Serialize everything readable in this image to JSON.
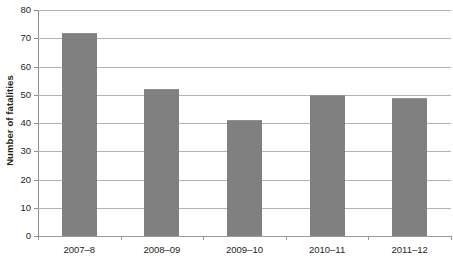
{
  "chart_data": {
    "type": "bar",
    "title": "",
    "subtitle": "",
    "xlabel": "",
    "ylabel": "Number of fatalities",
    "categories": [
      "2007–8",
      "2008–09",
      "2009–10",
      "2010–11",
      "2011–12"
    ],
    "values": [
      72,
      52,
      41,
      50,
      49
    ],
    "series": [
      {
        "name": "Number of fatalities",
        "values": [
          72,
          52,
          41,
          50,
          49
        ]
      }
    ],
    "ylim": [
      0,
      80
    ],
    "ytick_step": 10,
    "yticks": [
      0,
      10,
      20,
      30,
      40,
      50,
      60,
      70,
      80
    ],
    "ytick_labels": [
      "0",
      "10",
      "20",
      "30",
      "40",
      "50",
      "60",
      "70",
      "80"
    ],
    "grid": true,
    "grid_axis": "y",
    "legend": false,
    "legend_position": "none",
    "annotations": [],
    "data_labels": false,
    "bar_color": "#808080",
    "grid_color": "#b3b3b3",
    "axis_color": "#8c8c8c",
    "text_color": "#231f20",
    "background_color": "#ffffff"
  }
}
